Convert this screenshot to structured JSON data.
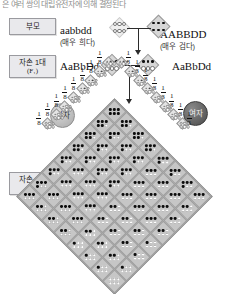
{
  "header": {
    "cutoff_text": "은 여러 쌍의 대립유전자에 의해 결정된다"
  },
  "generations": {
    "parent": {
      "label": "부모"
    },
    "f1": {
      "label": "자손 1대",
      "sub": "(F₁)"
    },
    "f2": {
      "label": "자손 2대",
      "sub": "(F₂)"
    }
  },
  "cross": {
    "parent_left": {
      "genotype": "aabbdd",
      "phenotype": "(매우 희다)"
    },
    "parent_right": {
      "genotype": "AABBDD",
      "phenotype": "(매우 검다)"
    },
    "f1_left": {
      "genotype": "AaBbDd"
    },
    "f1_right": {
      "genotype": "AaBbDd"
    }
  },
  "sexes": {
    "male": {
      "label": "남자"
    },
    "female": {
      "label": "여자"
    }
  },
  "gametes": {
    "fraction_numerator": "1",
    "fraction_denominator": "8",
    "count_per_side": 8,
    "male_dot_counts": [
      3,
      2,
      2,
      2,
      1,
      1,
      1,
      0
    ],
    "female_dot_counts": [
      3,
      2,
      2,
      2,
      1,
      1,
      1,
      0
    ]
  },
  "chart_data": {
    "type": "table",
    "rows": 8,
    "cols": 8,
    "row_gametes": [
      "ABD",
      "ABd",
      "AbD",
      "aBD",
      "Abd",
      "aBd",
      "abD",
      "abd"
    ],
    "col_gametes": [
      "ABD",
      "ABd",
      "AbD",
      "aBD",
      "Abd",
      "aBd",
      "abD",
      "abd"
    ],
    "row_gamete_dominant_counts": [
      3,
      2,
      2,
      2,
      1,
      1,
      1,
      0
    ],
    "col_gamete_dominant_counts": [
      3,
      2,
      2,
      2,
      1,
      1,
      1,
      0
    ],
    "cell_dominant_allele_counts": [
      [
        6,
        5,
        5,
        5,
        4,
        4,
        4,
        3
      ],
      [
        5,
        4,
        4,
        4,
        3,
        3,
        3,
        2
      ],
      [
        5,
        4,
        4,
        4,
        3,
        3,
        3,
        2
      ],
      [
        5,
        4,
        4,
        4,
        3,
        3,
        3,
        2
      ],
      [
        4,
        3,
        3,
        3,
        2,
        2,
        2,
        1
      ],
      [
        4,
        3,
        3,
        3,
        2,
        2,
        2,
        1
      ],
      [
        4,
        3,
        3,
        3,
        2,
        2,
        2,
        1
      ],
      [
        3,
        2,
        2,
        2,
        1,
        1,
        1,
        0
      ]
    ],
    "phenotype_distribution": {
      "categories": [
        "0",
        "1",
        "2",
        "3",
        "4",
        "5",
        "6"
      ],
      "values": [
        1,
        6,
        15,
        20,
        15,
        6,
        1
      ],
      "xlabel": "우성 대립유전자 수",
      "ylabel": "빈도 (/64)"
    }
  }
}
